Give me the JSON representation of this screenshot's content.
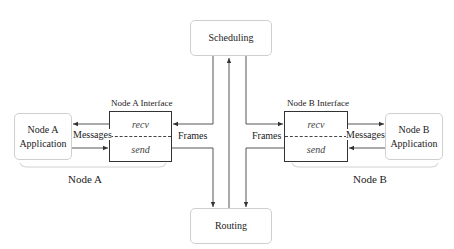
{
  "diagram": {
    "scheduling": {
      "label": "Scheduling"
    },
    "routing": {
      "label": "Routing"
    },
    "node_a": {
      "group_label": "Node A",
      "application": {
        "line1": "Node A",
        "line2": "Application"
      },
      "interface": {
        "title": "Node A Interface",
        "recv": "recv",
        "send": "send"
      },
      "messages_label": "Messages",
      "frames_label": "Frames"
    },
    "node_b": {
      "group_label": "Node B",
      "application": {
        "line1": "Node B",
        "line2": "Application"
      },
      "interface": {
        "title": "Node B Interface",
        "recv": "recv",
        "send": "send"
      },
      "messages_label": "Messages",
      "frames_label": "Frames"
    },
    "colors": {
      "line": "#444444",
      "soft_border": "#cfcfcf",
      "brace": "#d0d0d0"
    }
  }
}
